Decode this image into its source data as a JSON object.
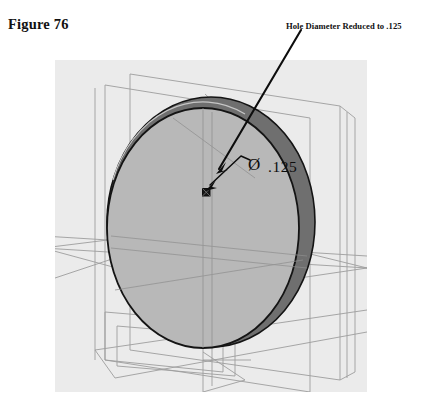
{
  "figure": {
    "label": "Figure 76"
  },
  "annotation": {
    "note_text": "Hole Diameter Reduced to .125",
    "leader_from": {
      "x": 300,
      "y": 32
    },
    "leader_to": {
      "x": 216,
      "y": 173
    }
  },
  "dimension": {
    "symbol": "Ø",
    "value": ".125",
    "full_text": "Ø .125",
    "leader_from": {
      "x": 252,
      "y": 160
    },
    "leader_to": {
      "x": 206,
      "y": 192
    }
  },
  "drawing": {
    "type": "cad-3d-wireframe-shaded",
    "description": "Shaded circular disc with darker rim crescent, shown with wireframe reference planes",
    "canvas": {
      "x": 55,
      "y": 60,
      "width": 312,
      "height": 332
    },
    "colors": {
      "page_background": "#ffffff",
      "canvas_background": "#ebebeb",
      "face_fill": "#b9b9b9",
      "rim_fill": "#6f6f6f",
      "outline": "#141414",
      "wireframe": "#9a9a9a",
      "annotation_text": "#111111"
    },
    "disc": {
      "front_face": {
        "cx": 203,
        "cy": 228,
        "rx": 96,
        "ry": 120,
        "fill": "#b9b9b9"
      },
      "back_edge": {
        "cx": 211,
        "cy": 222,
        "rx": 104,
        "ry": 125,
        "fill": "#6f6f6f"
      }
    },
    "hole": {
      "marker": "small-square-hole",
      "cx": 206,
      "cy": 192,
      "size": 7,
      "diameter_label": ".125"
    },
    "reference_planes": [
      "vertical-plane-left",
      "vertical-plane-right",
      "horizontal-plane-mid",
      "horizontal-plane-lower",
      "nested-rect-bottom-left"
    ]
  }
}
